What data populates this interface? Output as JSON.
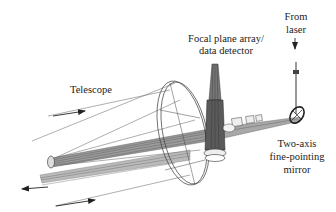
{
  "diagram": {
    "type": "optical-system-wireframe",
    "labels": {
      "telescope": "Telescope",
      "focal_plane_line1": "Focal plane array/",
      "focal_plane_line2": "data detector",
      "from_laser_line1": "From",
      "from_laser_line2": "laser",
      "mirror_line1": "Two-axis",
      "mirror_line2": "fine-pointing",
      "mirror_line3": "mirror"
    },
    "arrows": [
      {
        "name": "incoming-beam-arrow-top",
        "direction": "right"
      },
      {
        "name": "outgoing-beam-arrow-left",
        "direction": "left"
      },
      {
        "name": "incoming-beam-arrow-bottom",
        "direction": "right"
      },
      {
        "name": "laser-down-arrow",
        "direction": "down"
      }
    ],
    "colors": {
      "line": "#555555",
      "dark": "#333333",
      "text": "#222222",
      "background": "#ffffff"
    }
  }
}
